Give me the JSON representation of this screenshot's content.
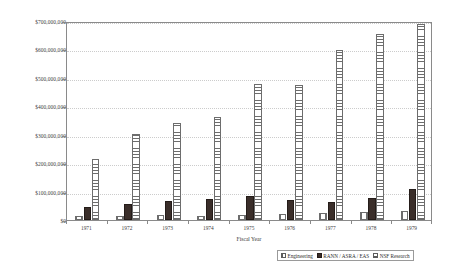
{
  "chart_data": {
    "type": "bar",
    "title": "",
    "subtitle": "",
    "xlabel": "Fiscal Year",
    "ylabel": "",
    "categories": [
      "1971",
      "1972",
      "1973",
      "1974",
      "1975",
      "1976",
      "1977",
      "1978",
      "1979"
    ],
    "series": [
      {
        "name": "Engineering",
        "pattern": "vertical-stripes",
        "values": [
          13000000,
          15000000,
          18000000,
          14000000,
          17000000,
          20000000,
          25000000,
          27000000,
          30000000
        ]
      },
      {
        "name": "RANN / ASRA / EAS",
        "pattern": "solid-dark",
        "values": [
          45000000,
          57000000,
          66000000,
          74000000,
          83000000,
          70000000,
          62000000,
          77000000,
          110000000
        ]
      },
      {
        "name": "NSF Research",
        "pattern": "horizontal-stripes",
        "values": [
          213000000,
          302000000,
          343000000,
          363000000,
          478000000,
          475000000,
          597000000,
          655000000,
          688000000
        ]
      }
    ],
    "ylim": [
      0,
      700000000
    ],
    "y_tick_values": [
      0,
      100000000,
      200000000,
      300000000,
      400000000,
      500000000,
      600000000,
      700000000
    ],
    "y_tick_labels": [
      "$0",
      "$100,000,000",
      "$200,000,000",
      "$300,000,000",
      "$400,000,000",
      "$500,000,000",
      "$600,000,000",
      "$700,000,000"
    ],
    "grid": true,
    "grid_axis": "y",
    "legend_position": "bottom-right",
    "legend_entries": [
      "Engineering",
      "RANN / ASRA / EAS",
      "NSF Research"
    ],
    "colors": {
      "engineering": "#ffffff",
      "rann": "#3a2e2a",
      "nsf": "#ffffff",
      "outline": "#6d6d6d",
      "axis": "#8a8a8a",
      "gridline": "#cccccc",
      "text": "#3d3d3d",
      "background": "#ffffff"
    }
  }
}
